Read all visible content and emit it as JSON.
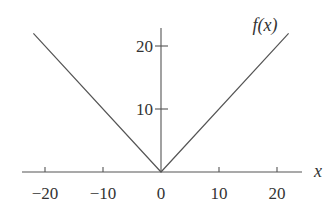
{
  "chart_data": {
    "type": "line",
    "title": "",
    "function": "f(x) = |x|",
    "series": [
      {
        "name": "f(x)",
        "x": [
          -22,
          0,
          22
        ],
        "values": [
          22,
          0,
          22
        ],
        "color": "#555555"
      }
    ],
    "xlabel": "x",
    "ylabel": "f(x)",
    "xticks": [
      -20,
      -10,
      0,
      10,
      20
    ],
    "xtick_labels": [
      "−20",
      "−10",
      "0",
      "10",
      "20"
    ],
    "yticks": [
      10,
      20
    ],
    "ytick_labels": [
      "10",
      "20"
    ],
    "xlim": [
      -24.5,
      24
    ],
    "ylim": [
      0,
      22.5
    ],
    "grid": false,
    "legend": "none"
  }
}
